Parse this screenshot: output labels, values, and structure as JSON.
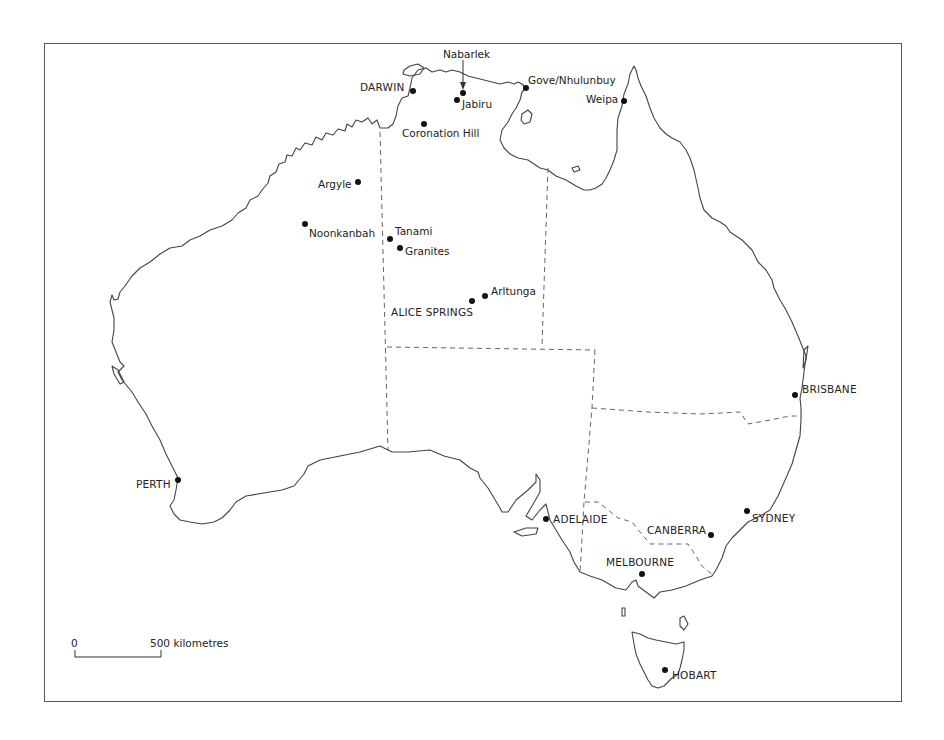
{
  "map": {
    "type": "reference map",
    "region": "Australia",
    "scale_bar": {
      "start_label": "0",
      "end_label": "500 kilometres"
    },
    "cities": [
      {
        "id": "darwin",
        "label": "DARWIN",
        "capital": true
      },
      {
        "id": "perth",
        "label": "PERTH",
        "capital": true
      },
      {
        "id": "adelaide",
        "label": "ADELAIDE",
        "capital": true
      },
      {
        "id": "melbourne",
        "label": "MELBOURNE",
        "capital": true
      },
      {
        "id": "canberra",
        "label": "CANBERRA",
        "capital": true
      },
      {
        "id": "sydney",
        "label": "SYDNEY",
        "capital": true
      },
      {
        "id": "brisbane",
        "label": "BRISBANE",
        "capital": true
      },
      {
        "id": "hobart",
        "label": "HOBART",
        "capital": true
      },
      {
        "id": "alice_springs",
        "label": "ALICE SPRINGS",
        "capital": false
      }
    ],
    "sites": [
      {
        "id": "nabarlek",
        "label": "Nabarlek"
      },
      {
        "id": "jabiru",
        "label": "Jabiru"
      },
      {
        "id": "coronation_hill",
        "label": "Coronation Hill"
      },
      {
        "id": "gove",
        "label": "Gove/Nhulunbuy"
      },
      {
        "id": "weipa",
        "label": "Weipa"
      },
      {
        "id": "argyle",
        "label": "Argyle"
      },
      {
        "id": "noonkanbah",
        "label": "Noonkanbah"
      },
      {
        "id": "tanami",
        "label": "Tanami"
      },
      {
        "id": "granites",
        "label": "Granites"
      },
      {
        "id": "arltunga",
        "label": "Arltunga"
      }
    ],
    "colors": {
      "line": "#444444",
      "border_dash": "#666666",
      "marker": "#111111",
      "background": "#ffffff"
    }
  }
}
